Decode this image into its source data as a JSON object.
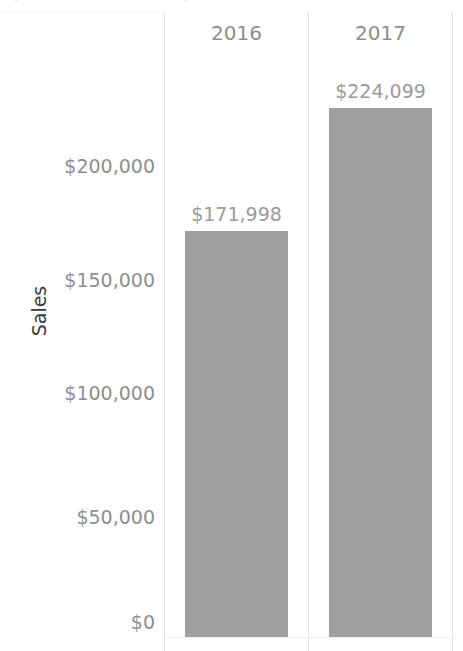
{
  "chart_data": {
    "type": "bar",
    "title": "",
    "xlabel": "",
    "ylabel": "Sales",
    "categories": [
      "2016",
      "2017"
    ],
    "values": [
      171998,
      224099
    ],
    "value_labels": [
      "$171,998",
      "$224,099"
    ],
    "ytick_labels": [
      "$200,000",
      "$150,000",
      "$100,000",
      "$50,000",
      "$0"
    ],
    "ytick_values": [
      200000,
      150000,
      100000,
      50000,
      0
    ],
    "ylim": [
      0,
      240000
    ],
    "grid": false,
    "legend": "none",
    "bar_color": "#a0a0a0",
    "label_color": "#9a9a9a",
    "axis_text_color": "#8e8e8e",
    "axis_title_color": "#3a3a3a",
    "divider_color": "#e3e3e3",
    "background": "#ffffff"
  },
  "headers": {
    "col_2016": "2016",
    "col_2017": "2017"
  },
  "axis": {
    "sales_title": "Sales",
    "tick_200k": "$200,000",
    "tick_150k": "$150,000",
    "tick_100k": "$100,000",
    "tick_50k": "$50,000",
    "tick_0": "$0"
  },
  "labels": {
    "bar_2016": "$171,998",
    "bar_2017": "$224,099"
  },
  "title_remnant": {
    "segment_a": "·",
    "segment_b": "·"
  }
}
